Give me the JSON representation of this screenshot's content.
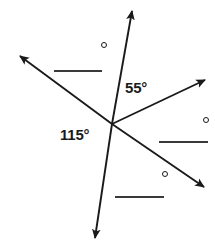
{
  "figure": {
    "background_color": "#ffffff",
    "stroke_color": "#1a1a1a",
    "line_color": "#3a3a3a",
    "vertex": {
      "x": 112,
      "y": 124
    },
    "rays": [
      {
        "name": "ray-up-right",
        "tip_x": 132,
        "tip_y": 3,
        "arrow": true
      },
      {
        "name": "ray-up-left",
        "tip_x": 11,
        "tip_y": 51,
        "arrow": true
      },
      {
        "name": "ray-right",
        "tip_x": 214,
        "tip_y": 75,
        "arrow": true
      },
      {
        "name": "ray-down-right",
        "tip_x": 213,
        "tip_y": 195,
        "arrow": true
      },
      {
        "name": "ray-down",
        "tip_x": 93,
        "tip_y": 248,
        "arrow": true
      }
    ],
    "angle_labels": [
      {
        "name": "angle-55",
        "text": "55°",
        "x": 125,
        "y": 80
      },
      {
        "name": "angle-115",
        "text": "115°",
        "x": 60,
        "y": 127
      }
    ],
    "degree_marks": [
      {
        "name": "degree-mark-top",
        "x": 101,
        "y": 42
      },
      {
        "name": "degree-mark-right",
        "x": 203,
        "y": 117
      },
      {
        "name": "degree-mark-bottom",
        "x": 162,
        "y": 171
      }
    ],
    "blank_answer_lines": [
      {
        "name": "blank-line-topleft",
        "x": 54,
        "y": 70,
        "width": 48
      },
      {
        "name": "blank-line-right",
        "x": 159,
        "y": 141,
        "width": 49
      },
      {
        "name": "blank-line-bottom",
        "x": 115,
        "y": 196,
        "width": 49
      }
    ]
  },
  "labels": {
    "angle_55": "55°",
    "angle_115": "115°"
  }
}
